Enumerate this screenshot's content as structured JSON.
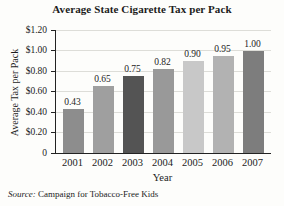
{
  "chart_data": {
    "type": "bar",
    "title": "Average State Cigarette Tax per Pack",
    "xlabel": "Year",
    "ylabel": "Average Tax per Pack",
    "categories": [
      "2001",
      "2002",
      "2003",
      "2004",
      "2005",
      "2006",
      "2007"
    ],
    "values": [
      0.43,
      0.65,
      0.75,
      0.82,
      0.9,
      0.95,
      1.0
    ],
    "value_labels": [
      "0.43",
      "0.65",
      "0.75",
      "0.82",
      "0.90",
      "0.95",
      "1.00"
    ],
    "bar_colors": [
      "#8d8d8d",
      "#9f9f9f",
      "#545454",
      "#999999",
      "#c8c8c8",
      "#b2b2b2",
      "#7d7d7d"
    ],
    "ylim": [
      0,
      1.2
    ],
    "ytick_values": [
      1.2,
      1.0,
      0.8,
      0.6,
      0.4,
      0.2,
      0
    ],
    "ytick_labels": [
      "$1.20",
      "$1.00",
      "$0.80",
      "$0.60",
      "$0.40",
      "$0.20",
      "0"
    ],
    "grid": true,
    "legend_position": "none"
  },
  "source_note": {
    "prefix": "Source:",
    "text": " Campaign for Tobacco-Free Kids"
  },
  "colors": {
    "axis": "#222222",
    "gridline": "#ddddd8",
    "text": "#1c1c1c",
    "background": "#fdfdfb"
  }
}
